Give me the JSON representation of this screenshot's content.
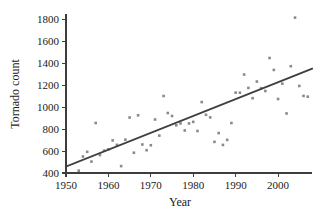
{
  "chart_data": {
    "type": "scatter",
    "title": "",
    "xlabel": "Year",
    "ylabel": "Tornado count",
    "xlim": [
      1950,
      2008
    ],
    "ylim": [
      400,
      1850
    ],
    "grid": false,
    "legend": "none",
    "marker": "square",
    "marker_color": "#8a8a8a",
    "xticks": [
      1950,
      1960,
      1970,
      1980,
      1990,
      2000
    ],
    "xtick_labels": [
      "1950",
      "1960",
      "1970",
      "1980",
      "1990",
      "2000"
    ],
    "yticks": [
      400,
      600,
      800,
      1000,
      1200,
      1400,
      1600,
      1800
    ],
    "ytick_labels": [
      "400",
      "600",
      "800",
      "1000",
      "1200",
      "1400",
      "1600",
      "1800"
    ],
    "x": [
      1953,
      1954,
      1955,
      1956,
      1957,
      1958,
      1959,
      1960,
      1961,
      1962,
      1963,
      1964,
      1965,
      1966,
      1967,
      1968,
      1969,
      1970,
      1971,
      1972,
      1973,
      1974,
      1975,
      1976,
      1977,
      1978,
      1979,
      1980,
      1981,
      1982,
      1983,
      1984,
      1985,
      1986,
      1987,
      1988,
      1989,
      1990,
      1991,
      1992,
      1993,
      1994,
      1995,
      1996,
      1997,
      1998,
      1999,
      2000,
      2001,
      2002,
      2003,
      2004,
      2005,
      2006,
      2007
    ],
    "y": [
      421,
      550,
      593,
      504,
      856,
      564,
      604,
      616,
      697,
      657,
      463,
      704,
      906,
      585,
      926,
      660,
      608,
      653,
      888,
      741,
      1102,
      947,
      920,
      835,
      852,
      788,
      852,
      866,
      783,
      1047,
      931,
      907,
      684,
      764,
      656,
      702,
      856,
      1133,
      1132,
      1298,
      1176,
      1082,
      1234,
      1173,
      1148,
      1449,
      1340,
      1075,
      1215,
      943,
      1374,
      1817,
      1194,
      1103,
      1096
    ],
    "fit_line": {
      "x": [
        1950,
        2008
      ],
      "y": [
        459,
        1350
      ],
      "description": "least squares regression line"
    },
    "n_points": 55
  }
}
